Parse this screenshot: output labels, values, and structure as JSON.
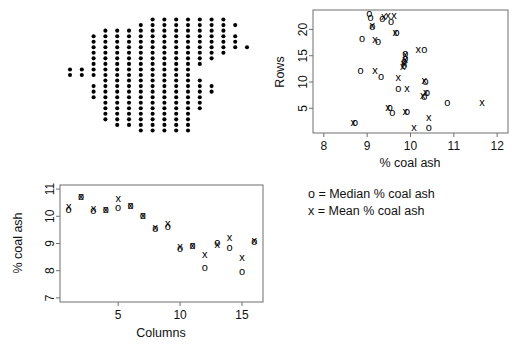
{
  "figure": {
    "background": "#ffffff",
    "ink": "#000000",
    "frame_color": "#6e6e6e"
  },
  "legend": {
    "name": "plot-legend",
    "lines": [
      "o = Median % coal ash",
      "x = Mean % coal ash"
    ],
    "median_symbol": "o",
    "mean_symbol": "x",
    "median_label": "Median % coal ash",
    "mean_label": "Mean % coal ash"
  },
  "chart_data": [
    {
      "id": "coal-ash-sampling-grid",
      "type": "scatter",
      "title": "",
      "subtitle": "",
      "xlabel": "",
      "ylabel": "",
      "grid": false,
      "axes_visible": false,
      "legend_position": "none",
      "marker": "filled-circle",
      "description": "Spatial sampling grid of coal ash boreholes; one filled dot per sampled location on a 16 column by 23 row lattice.",
      "xlim": [
        0.5,
        16.5
      ],
      "ylim": [
        0.5,
        23.5
      ],
      "n_points": 208,
      "columns_range": [
        1,
        16
      ],
      "rows_range": [
        1,
        23
      ],
      "points": [
        [
          1,
          12
        ],
        [
          1,
          13
        ],
        [
          2,
          12
        ],
        [
          2,
          13
        ],
        [
          3,
          8
        ],
        [
          3,
          9
        ],
        [
          3,
          10
        ],
        [
          3,
          12
        ],
        [
          3,
          13
        ],
        [
          3,
          14
        ],
        [
          3,
          15
        ],
        [
          3,
          16
        ],
        [
          3,
          17
        ],
        [
          3,
          18
        ],
        [
          3,
          19
        ],
        [
          4,
          4
        ],
        [
          4,
          5
        ],
        [
          4,
          6
        ],
        [
          4,
          7
        ],
        [
          4,
          8
        ],
        [
          4,
          9
        ],
        [
          4,
          10
        ],
        [
          4,
          11
        ],
        [
          4,
          12
        ],
        [
          4,
          13
        ],
        [
          4,
          14
        ],
        [
          4,
          15
        ],
        [
          4,
          16
        ],
        [
          4,
          17
        ],
        [
          4,
          18
        ],
        [
          4,
          19
        ],
        [
          4,
          20
        ],
        [
          5,
          3
        ],
        [
          5,
          4
        ],
        [
          5,
          5
        ],
        [
          5,
          6
        ],
        [
          5,
          7
        ],
        [
          5,
          8
        ],
        [
          5,
          9
        ],
        [
          5,
          10
        ],
        [
          5,
          11
        ],
        [
          5,
          12
        ],
        [
          5,
          13
        ],
        [
          5,
          14
        ],
        [
          5,
          15
        ],
        [
          5,
          16
        ],
        [
          5,
          17
        ],
        [
          5,
          18
        ],
        [
          5,
          19
        ],
        [
          5,
          20
        ],
        [
          6,
          3
        ],
        [
          6,
          4
        ],
        [
          6,
          5
        ],
        [
          6,
          6
        ],
        [
          6,
          7
        ],
        [
          6,
          8
        ],
        [
          6,
          9
        ],
        [
          6,
          10
        ],
        [
          6,
          11
        ],
        [
          6,
          12
        ],
        [
          6,
          13
        ],
        [
          6,
          14
        ],
        [
          6,
          15
        ],
        [
          6,
          16
        ],
        [
          6,
          17
        ],
        [
          6,
          18
        ],
        [
          6,
          19
        ],
        [
          6,
          20
        ],
        [
          7,
          2
        ],
        [
          7,
          3
        ],
        [
          7,
          4
        ],
        [
          7,
          5
        ],
        [
          7,
          6
        ],
        [
          7,
          7
        ],
        [
          7,
          8
        ],
        [
          7,
          9
        ],
        [
          7,
          10
        ],
        [
          7,
          11
        ],
        [
          7,
          12
        ],
        [
          7,
          13
        ],
        [
          7,
          14
        ],
        [
          7,
          15
        ],
        [
          7,
          16
        ],
        [
          7,
          17
        ],
        [
          7,
          18
        ],
        [
          7,
          19
        ],
        [
          7,
          20
        ],
        [
          7,
          21
        ],
        [
          8,
          2
        ],
        [
          8,
          3
        ],
        [
          8,
          4
        ],
        [
          8,
          5
        ],
        [
          8,
          6
        ],
        [
          8,
          7
        ],
        [
          8,
          8
        ],
        [
          8,
          9
        ],
        [
          8,
          10
        ],
        [
          8,
          11
        ],
        [
          8,
          12
        ],
        [
          8,
          13
        ],
        [
          8,
          14
        ],
        [
          8,
          15
        ],
        [
          8,
          16
        ],
        [
          8,
          17
        ],
        [
          8,
          18
        ],
        [
          8,
          19
        ],
        [
          8,
          20
        ],
        [
          8,
          21
        ],
        [
          8,
          22
        ],
        [
          9,
          2
        ],
        [
          9,
          3
        ],
        [
          9,
          4
        ],
        [
          9,
          5
        ],
        [
          9,
          6
        ],
        [
          9,
          7
        ],
        [
          9,
          8
        ],
        [
          9,
          9
        ],
        [
          9,
          10
        ],
        [
          9,
          11
        ],
        [
          9,
          12
        ],
        [
          9,
          13
        ],
        [
          9,
          14
        ],
        [
          9,
          15
        ],
        [
          9,
          16
        ],
        [
          9,
          17
        ],
        [
          9,
          18
        ],
        [
          9,
          19
        ],
        [
          9,
          20
        ],
        [
          9,
          21
        ],
        [
          9,
          22
        ],
        [
          10,
          2
        ],
        [
          10,
          3
        ],
        [
          10,
          4
        ],
        [
          10,
          5
        ],
        [
          10,
          6
        ],
        [
          10,
          7
        ],
        [
          10,
          8
        ],
        [
          10,
          9
        ],
        [
          10,
          10
        ],
        [
          10,
          11
        ],
        [
          10,
          12
        ],
        [
          10,
          13
        ],
        [
          10,
          14
        ],
        [
          10,
          15
        ],
        [
          10,
          16
        ],
        [
          10,
          17
        ],
        [
          10,
          18
        ],
        [
          10,
          19
        ],
        [
          10,
          20
        ],
        [
          10,
          21
        ],
        [
          10,
          22
        ],
        [
          11,
          2
        ],
        [
          11,
          3
        ],
        [
          11,
          4
        ],
        [
          11,
          5
        ],
        [
          11,
          6
        ],
        [
          11,
          7
        ],
        [
          11,
          8
        ],
        [
          11,
          9
        ],
        [
          11,
          10
        ],
        [
          11,
          11
        ],
        [
          11,
          12
        ],
        [
          11,
          13
        ],
        [
          11,
          14
        ],
        [
          11,
          15
        ],
        [
          11,
          16
        ],
        [
          11,
          17
        ],
        [
          11,
          18
        ],
        [
          11,
          19
        ],
        [
          11,
          20
        ],
        [
          11,
          21
        ],
        [
          11,
          22
        ],
        [
          12,
          6
        ],
        [
          12,
          7
        ],
        [
          12,
          8
        ],
        [
          12,
          9
        ],
        [
          12,
          10
        ],
        [
          12,
          11
        ],
        [
          12,
          14
        ],
        [
          12,
          15
        ],
        [
          12,
          16
        ],
        [
          12,
          17
        ],
        [
          12,
          18
        ],
        [
          12,
          19
        ],
        [
          12,
          20
        ],
        [
          12,
          21
        ],
        [
          12,
          22
        ],
        [
          13,
          9
        ],
        [
          13,
          10
        ],
        [
          13,
          15
        ],
        [
          13,
          16
        ],
        [
          13,
          17
        ],
        [
          13,
          18
        ],
        [
          13,
          19
        ],
        [
          13,
          20
        ],
        [
          13,
          21
        ],
        [
          13,
          22
        ],
        [
          14,
          16
        ],
        [
          14,
          17
        ],
        [
          14,
          18
        ],
        [
          14,
          19
        ],
        [
          14,
          20
        ],
        [
          14,
          21
        ],
        [
          14,
          22
        ],
        [
          15,
          17
        ],
        [
          15,
          18
        ],
        [
          15,
          19
        ],
        [
          15,
          21
        ],
        [
          16,
          17
        ]
      ]
    },
    {
      "id": "coal-ash-by-row",
      "type": "scatter",
      "title": "",
      "xlabel": "% coal ash",
      "ylabel": "Rows",
      "grid": false,
      "legend_position": "below-plot",
      "xlim": [
        7.75,
        12.25
      ],
      "ylim": [
        0.3,
        23.7
      ],
      "xticks": [
        8,
        9,
        10,
        11,
        12
      ],
      "yticks": [
        5,
        10,
        15,
        20
      ],
      "series": [
        {
          "name": "Median % coal ash",
          "marker": "o",
          "points": [
            [
              9.05,
              23.0
            ],
            [
              9.08,
              22.2
            ],
            [
              9.35,
              21.9
            ],
            [
              9.55,
              21.4
            ],
            [
              9.12,
              20.5
            ],
            [
              9.68,
              19.3
            ],
            [
              8.88,
              18.2
            ],
            [
              9.25,
              17.5
            ],
            [
              10.32,
              16.1
            ],
            [
              9.88,
              15.4
            ],
            [
              9.88,
              14.4
            ],
            [
              9.85,
              13.8
            ],
            [
              9.85,
              13.0
            ],
            [
              8.85,
              12.0
            ],
            [
              9.32,
              11.0
            ],
            [
              10.35,
              10.0
            ],
            [
              9.72,
              8.7
            ],
            [
              10.38,
              7.9
            ],
            [
              10.32,
              7.2
            ],
            [
              10.85,
              6.0
            ],
            [
              9.52,
              5.0
            ],
            [
              9.58,
              4.0
            ],
            [
              9.92,
              4.2
            ],
            [
              10.42,
              1.2
            ],
            [
              8.72,
              2.1
            ]
          ]
        },
        {
          "name": "Mean % coal ash",
          "marker": "x",
          "points": [
            [
              9.48,
              22.6
            ],
            [
              9.62,
              22.6
            ],
            [
              9.38,
              22.3
            ],
            [
              9.12,
              20.6
            ],
            [
              9.65,
              19.3
            ],
            [
              9.18,
              17.9
            ],
            [
              10.18,
              16.1
            ],
            [
              9.88,
              15.2
            ],
            [
              9.88,
              14.2
            ],
            [
              9.85,
              13.4
            ],
            [
              9.82,
              12.9
            ],
            [
              9.72,
              10.8
            ],
            [
              9.18,
              12.0
            ],
            [
              10.32,
              10.1
            ],
            [
              9.92,
              8.7
            ],
            [
              10.35,
              7.9
            ],
            [
              10.28,
              7.3
            ],
            [
              11.65,
              6.0
            ],
            [
              9.48,
              5.1
            ],
            [
              9.88,
              4.2
            ],
            [
              10.42,
              3.1
            ],
            [
              10.08,
              1.2
            ],
            [
              8.68,
              2.1
            ]
          ]
        }
      ]
    },
    {
      "id": "coal-ash-by-column",
      "type": "scatter",
      "title": "",
      "xlabel": "Columns",
      "ylabel": "% coal ash",
      "grid": false,
      "legend_position": "none",
      "xlim": [
        0.3,
        16.7
      ],
      "ylim": [
        6.85,
        11.15
      ],
      "xticks": [
        5,
        10,
        15
      ],
      "yticks": [
        7,
        8,
        9,
        10,
        11
      ],
      "series": [
        {
          "name": "Median % coal ash",
          "marker": "o",
          "points": [
            [
              1,
              10.22
            ],
            [
              2,
              10.7
            ],
            [
              3,
              10.2
            ],
            [
              4,
              10.22
            ],
            [
              5,
              10.3
            ],
            [
              6,
              10.38
            ],
            [
              7,
              10.0
            ],
            [
              8,
              9.52
            ],
            [
              9,
              9.62
            ],
            [
              10,
              8.8
            ],
            [
              11,
              8.92
            ],
            [
              12,
              8.08
            ],
            [
              13,
              9.0
            ],
            [
              14,
              8.82
            ],
            [
              15,
              7.95
            ],
            [
              16,
              9.05
            ]
          ]
        },
        {
          "name": "Mean % coal ash",
          "marker": "x",
          "points": [
            [
              1,
              10.32
            ],
            [
              2,
              10.72
            ],
            [
              3,
              10.26
            ],
            [
              4,
              10.24
            ],
            [
              5,
              10.65
            ],
            [
              6,
              10.38
            ],
            [
              7,
              10.0
            ],
            [
              8,
              9.58
            ],
            [
              9,
              9.7
            ],
            [
              10,
              8.88
            ],
            [
              11,
              8.9
            ],
            [
              12,
              8.58
            ],
            [
              13,
              8.95
            ],
            [
              14,
              9.2
            ],
            [
              15,
              8.48
            ],
            [
              16,
              9.08
            ]
          ]
        }
      ]
    }
  ]
}
